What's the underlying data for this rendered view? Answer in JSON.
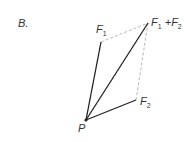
{
  "diagram": {
    "panel_label": "B.",
    "origin": {
      "label": "P",
      "x": 86,
      "y": 120
    },
    "vectors": [
      {
        "name": "F1",
        "base": "F",
        "sub": "1",
        "tip": {
          "x": 101,
          "y": 42
        },
        "style": "solid"
      },
      {
        "name": "F2",
        "base": "F",
        "sub": "2",
        "tip": {
          "x": 136,
          "y": 100
        },
        "style": "solid"
      },
      {
        "name": "F1+F2",
        "tip": {
          "x": 148,
          "y": 23
        },
        "style": "solid"
      }
    ],
    "construction_lines": [
      {
        "from": "F1",
        "to": "F1+F2",
        "style": "dashed"
      },
      {
        "from": "F2",
        "to": "F1+F2",
        "style": "dashed"
      }
    ],
    "labels": {
      "f1": {
        "base": "F",
        "sub": "1"
      },
      "f2": {
        "base": "F",
        "sub": "2"
      },
      "sum": {
        "a_base": "F",
        "a_sub": "1",
        "op": " +",
        "b_base": "F",
        "b_sub": "2"
      },
      "p": "P"
    },
    "colors": {
      "line": "#222222",
      "dashed": "#b0b0b0",
      "text": "#333333"
    }
  }
}
